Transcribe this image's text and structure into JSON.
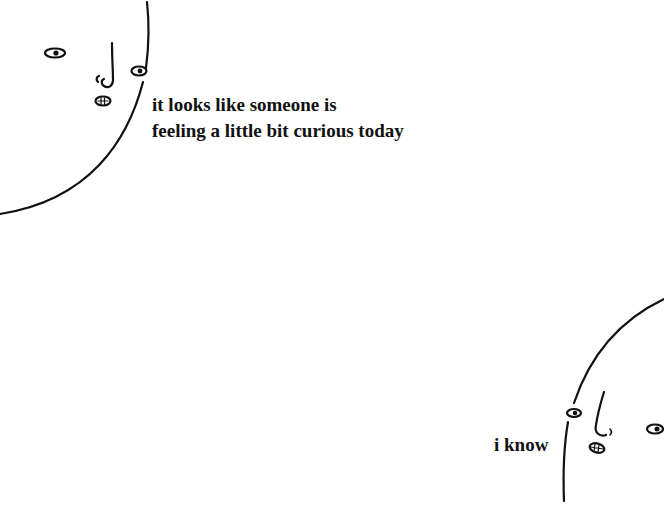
{
  "panel_top": {
    "caption_lines": [
      "it looks like someone is",
      "feeling a little bit curious today"
    ]
  },
  "panel_bottom": {
    "caption": "i know"
  },
  "colors": {
    "background": "#ffffff",
    "ink": "#111111"
  }
}
